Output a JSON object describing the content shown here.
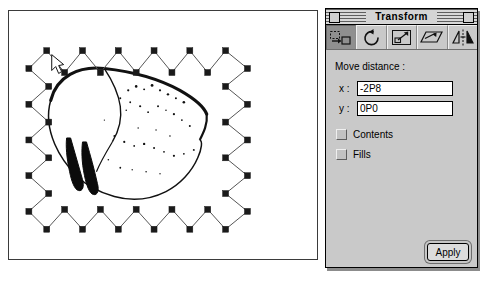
{
  "window": {
    "palette_title": "Transform",
    "close_box": "close-box",
    "zoom_box": "zoom-box"
  },
  "toolbar": {
    "tools": [
      {
        "name": "move-tool",
        "label": "Move",
        "active": true
      },
      {
        "name": "rotate-tool",
        "label": "Rotate",
        "active": false
      },
      {
        "name": "scale-tool",
        "label": "Scale",
        "active": false
      },
      {
        "name": "skew-tool",
        "label": "Skew",
        "active": false
      },
      {
        "name": "mirror-tool",
        "label": "Mirror",
        "active": false
      }
    ]
  },
  "panel": {
    "section_label": "Move distance :",
    "fields": {
      "x_label": "x :",
      "x_value": "-2P8",
      "y_label": "y :",
      "y_value": "0P0"
    },
    "checkboxes": [
      {
        "label": "Contents",
        "checked": false
      },
      {
        "label": "Fills",
        "checked": false
      }
    ],
    "apply_label": "Apply"
  },
  "canvas": {
    "description": "drawing-canvas with selected zigzag path and sketch artwork",
    "path_handles": 24
  },
  "colors": {
    "palette_face": "#c6c6c6",
    "window_border": "#000000",
    "field_background": "#ffffff",
    "active_tool": "#8f8f8f",
    "canvas_background": "#ffffff",
    "ink": "#000000"
  }
}
